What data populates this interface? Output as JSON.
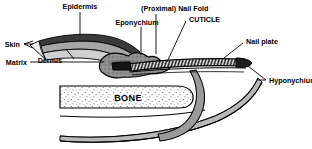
{
  "figure": {
    "title_visible": false,
    "background_color": "#ffffff",
    "ink_color": "#000000",
    "tissue_gray": "#8c8c8c",
    "tissue_light": "#c9c9c9",
    "nail_dark": "#1a1a1a"
  },
  "labels": {
    "epidermis": "Epidermis",
    "skin": "Skin",
    "dermis": "Dermis",
    "matrix": "Matrix",
    "eponychium": "Eponychium",
    "proximal_nail_fold": "(Proximal) Nail Fold",
    "cuticle": "CUTICLE",
    "nail_plate": "Nail plate",
    "hyponychium": "Hyponychium",
    "bone": "BONE"
  },
  "structures": [
    "skin-layer",
    "epidermis-layer",
    "dermis-layer",
    "nail-matrix",
    "nail-plate",
    "nail-bed",
    "distal-phalanx-bone",
    "fingertip-pulp"
  ]
}
